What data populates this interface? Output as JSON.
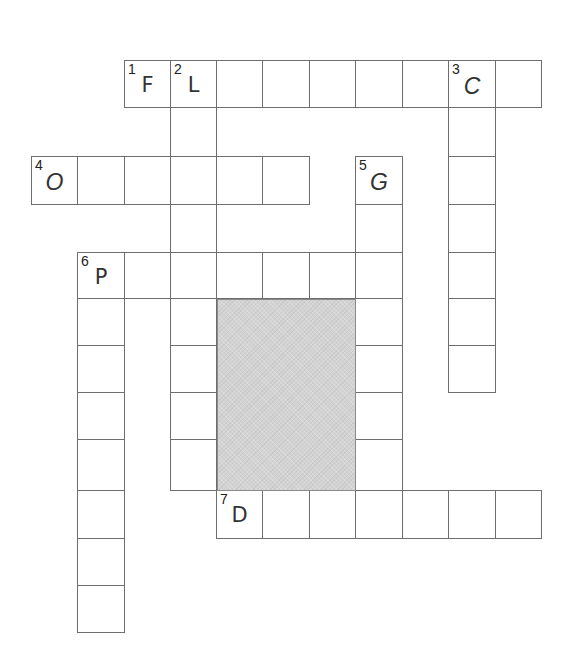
{
  "puzzle": {
    "type": "crossword",
    "colors": {
      "grid_line": "#6e6e6e",
      "shaded_block": "#d3d3d3",
      "background": "#ffffff"
    },
    "col_edges": [
      32,
      78,
      125,
      171,
      217,
      263,
      310,
      356,
      403,
      449,
      496,
      542
    ],
    "row_edges": [
      61,
      108,
      157,
      205,
      253,
      299,
      346,
      393,
      440,
      491,
      539,
      586,
      633
    ],
    "shaded_block": {
      "col_start": 4,
      "col_end": 7,
      "row_start": 5,
      "row_end": 9
    },
    "words": [
      {
        "number": 1,
        "direction": "across",
        "row": 0,
        "col": 2,
        "length": 9,
        "given": {
          "0": "F",
          "7": "C"
        }
      },
      {
        "number": 2,
        "direction": "down",
        "row": 0,
        "col": 3,
        "length": 9,
        "given": {
          "0": "L"
        }
      },
      {
        "number": 3,
        "direction": "down",
        "row": 0,
        "col": 9,
        "length": 7,
        "given": {
          "0": "C"
        }
      },
      {
        "number": 4,
        "direction": "across",
        "row": 2,
        "col": 0,
        "length": 6,
        "given": {
          "0": "O"
        }
      },
      {
        "number": 5,
        "direction": "down",
        "row": 2,
        "col": 7,
        "length": 8,
        "given": {
          "0": "G"
        }
      },
      {
        "number": 6,
        "direction": "across",
        "row": 4,
        "col": 1,
        "length": 7,
        "given": {
          "0": "P"
        }
      },
      {
        "number": 6,
        "direction": "down",
        "row": 4,
        "col": 1,
        "length": 8,
        "given": {
          "0": "P"
        }
      },
      {
        "number": 7,
        "direction": "across",
        "row": 9,
        "col": 4,
        "length": 7,
        "given": {
          "0": "D"
        }
      }
    ],
    "italic_letters": [
      "C",
      "O",
      "G"
    ]
  }
}
